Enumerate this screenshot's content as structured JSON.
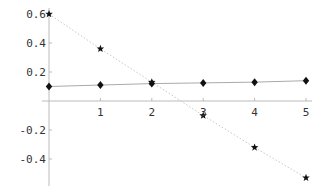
{
  "chart_data": {
    "type": "line",
    "title": "",
    "xlabel": "",
    "ylabel": "",
    "x": [
      0,
      1,
      2,
      3,
      4,
      5
    ],
    "series": [
      {
        "name": "stars",
        "marker": "star",
        "line_style": "dotted",
        "line_color": "#c8c8c8",
        "values": [
          0.6,
          0.36,
          0.13,
          -0.1,
          -0.32,
          -0.53
        ]
      },
      {
        "name": "diamonds",
        "marker": "diamond",
        "line_style": "solid",
        "line_color": "#aaaaaa",
        "values": [
          0.1,
          0.11,
          0.12,
          0.125,
          0.13,
          0.14
        ]
      }
    ],
    "xlim": [
      0,
      5
    ],
    "ylim": [
      -0.55,
      0.6
    ],
    "x_ticks": [
      "1",
      "2",
      "3",
      "4",
      "5"
    ],
    "y_ticks": [
      "0.6",
      "0.4",
      "0.2",
      "-0.2",
      "-0.4"
    ],
    "grid": false,
    "legend": null
  }
}
